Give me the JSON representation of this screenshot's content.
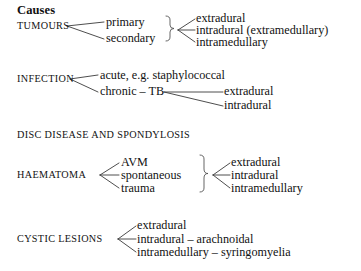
{
  "document": {
    "title": "Causes"
  },
  "sections": [
    {
      "category": "TUMOURS",
      "level1": [
        "primary",
        "secondary"
      ],
      "level2": [
        "extradural",
        "intradural (extramedullary)",
        "intramedullary"
      ],
      "brace": "}"
    },
    {
      "category": "INFECTION",
      "level1": [
        "acute, e.g. staphylococcal",
        "chronic – TB"
      ],
      "level2": [
        "extradural",
        "intradural"
      ]
    },
    {
      "category": "DISC DISEASE AND SPONDYLOSIS",
      "level1": [],
      "level2": []
    },
    {
      "category": "HAEMATOMA",
      "level1": [
        "AVM",
        "spontaneous",
        "trauma"
      ],
      "level2": [
        "extradural",
        "intradural",
        "intramedullary"
      ],
      "brace": "}"
    },
    {
      "category": "CYSTIC LESIONS",
      "level1": [
        "extradural",
        "intradural – arachnoidal",
        "intramedullary – syringomyelia"
      ],
      "level2": []
    }
  ],
  "colors": {
    "text": "#111111",
    "line": "#3a3a3a",
    "background": "#ffffff"
  }
}
